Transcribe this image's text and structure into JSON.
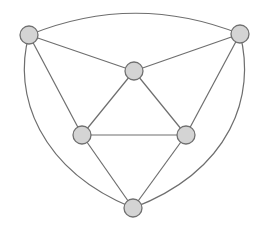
{
  "diagram": {
    "type": "planar-graph",
    "colors": {
      "node_fill": "#d4d4d4",
      "node_stroke": "#707070",
      "edge": "#6e6e6e",
      "background": "#ffffff"
    },
    "nodes": [
      {
        "id": "top-left",
        "x": 29,
        "y": 35,
        "r": 9
      },
      {
        "id": "top-right",
        "x": 240,
        "y": 34,
        "r": 9
      },
      {
        "id": "inner-top",
        "x": 134,
        "y": 71,
        "r": 9
      },
      {
        "id": "mid-left",
        "x": 82,
        "y": 135,
        "r": 9
      },
      {
        "id": "mid-right",
        "x": 186,
        "y": 135,
        "r": 9
      },
      {
        "id": "bottom",
        "x": 133,
        "y": 208,
        "r": 9
      }
    ],
    "edges": [
      {
        "from": "top-left",
        "to": "top-right",
        "curve": "arc-top"
      },
      {
        "from": "top-left",
        "to": "bottom",
        "curve": "arc-left"
      },
      {
        "from": "top-right",
        "to": "bottom",
        "curve": "arc-right"
      },
      {
        "from": "top-left",
        "to": "inner-top",
        "curve": "straight"
      },
      {
        "from": "top-right",
        "to": "inner-top",
        "curve": "straight"
      },
      {
        "from": "top-left",
        "to": "mid-left",
        "curve": "straight"
      },
      {
        "from": "top-right",
        "to": "mid-right",
        "curve": "straight"
      },
      {
        "from": "inner-top",
        "to": "mid-left",
        "curve": "straight"
      },
      {
        "from": "inner-top",
        "to": "mid-right",
        "curve": "straight"
      },
      {
        "from": "mid-left",
        "to": "mid-right",
        "curve": "straight"
      },
      {
        "from": "mid-left",
        "to": "bottom",
        "curve": "straight"
      },
      {
        "from": "mid-right",
        "to": "bottom",
        "curve": "straight"
      }
    ]
  }
}
